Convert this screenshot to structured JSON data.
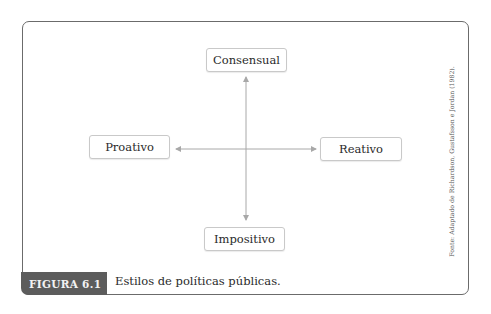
{
  "figure": {
    "label": "FIGURA 6.1",
    "caption": "Estilos de políticas públicas.",
    "source": "Fonte: Adaptado de Richardson, Gustafsson e Jordan (1982)."
  },
  "diagram": {
    "nodes": {
      "top": "Consensual",
      "left": "Proativo",
      "right": "Reativo",
      "bottom": "Impositivo"
    },
    "edges": [
      {
        "from": "center",
        "to": "Consensual",
        "type": "bidirectional-vertical"
      },
      {
        "from": "center",
        "to": "Impositivo",
        "type": "bidirectional-vertical"
      },
      {
        "from": "center",
        "to": "Proativo",
        "type": "bidirectional-horizontal"
      },
      {
        "from": "center",
        "to": "Reativo",
        "type": "bidirectional-horizontal"
      }
    ],
    "colors": {
      "frame": "#6b6b6b",
      "label_bg": "#5c5c5c",
      "arrow": "#a8a8a8",
      "box_border": "#c9c9c9"
    }
  }
}
